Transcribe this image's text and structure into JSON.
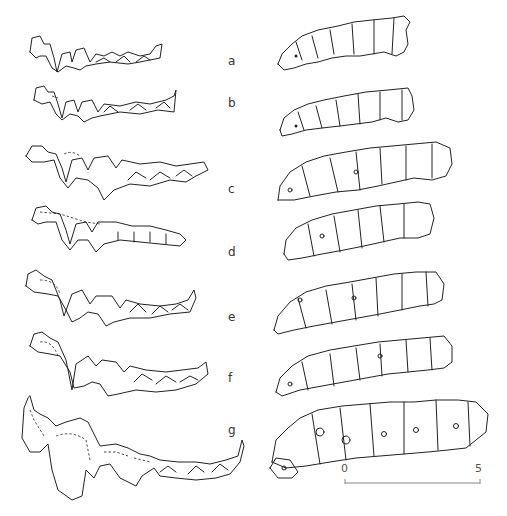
{
  "figure": {
    "rows": [
      {
        "label": "a",
        "x": 228,
        "y": 54
      },
      {
        "label": "b",
        "x": 228,
        "y": 96
      },
      {
        "label": "c",
        "x": 228,
        "y": 182
      },
      {
        "label": "d",
        "x": 228,
        "y": 245
      },
      {
        "label": "e",
        "x": 228,
        "y": 310
      },
      {
        "label": "f",
        "x": 228,
        "y": 371
      },
      {
        "label": "g",
        "x": 228,
        "y": 423
      }
    ],
    "left_column": "lateral view of tooth rows",
    "right_column": "occlusal view of tooth rows",
    "scale_bar": {
      "start_label": "0",
      "end_label": "5",
      "x1": 345,
      "x2": 480,
      "y": 483
    }
  }
}
